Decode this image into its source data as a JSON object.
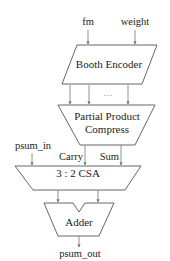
{
  "diagram": {
    "inputs": {
      "fm": "fm",
      "weight": "weight",
      "psum_in": "psum_in"
    },
    "blocks": {
      "booth_encoder": "Booth Encoder",
      "ppc_line1": "Partial Product",
      "ppc_line2": "Compress",
      "csa": "3 : 2 CSA",
      "adder": "Adder"
    },
    "signals": {
      "carry": "Carry",
      "sum": "Sum",
      "ellipsis": "…"
    },
    "outputs": {
      "psum_out": "psum_out"
    },
    "colors": {
      "stroke": "#555555",
      "wire": "#777777",
      "text": "#222222",
      "background": "#ffffff"
    }
  }
}
